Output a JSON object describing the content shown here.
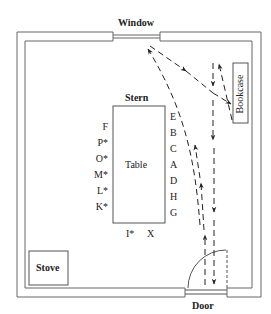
{
  "diagram": {
    "type": "floor-plan",
    "labels": {
      "window": "Window",
      "door": "Door",
      "stove": "Stove",
      "bookcase": "Bookcase",
      "table": "Table",
      "stern": "Stern"
    },
    "seats_left": [
      "F",
      "P*",
      "O*",
      "M*",
      "L*",
      "K*"
    ],
    "seats_right": [
      "E",
      "B",
      "C",
      "A",
      "D",
      "H",
      "G"
    ],
    "seats_bottom": [
      "I*",
      "X"
    ],
    "colors": {
      "line": "#555555",
      "text": "#222222",
      "background": "#ffffff"
    }
  }
}
